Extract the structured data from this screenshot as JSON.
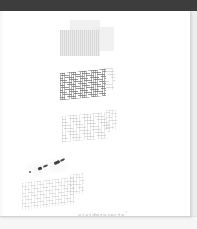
{
  "app": {
    "toolbar": {
      "name": "document-viewer-toolbar",
      "color": "#3d3d3d",
      "label": ""
    },
    "background_color": "#ededed"
  },
  "document": {
    "page_background": "#ffffff",
    "page_number_visible": false,
    "wordmark": {
      "text": "vividprojects",
      "trademark_symbol": "™",
      "color": "#9a9a9a"
    },
    "blocks": [
      {
        "id": "panel-group-top",
        "name": "faded-panel-group",
        "kind": "overlapping-grey-panels",
        "panels": [
          {
            "id": "panel-back",
            "color": "#efefef"
          },
          {
            "id": "panel-front",
            "color": "#e9e9e9"
          },
          {
            "id": "panel-right",
            "color": "#efefef"
          }
        ]
      },
      {
        "id": "grid-1",
        "name": "faded-table-grid-dense",
        "kind": "sheared-table-grid",
        "density": "dense",
        "skew_degrees": -5.5
      },
      {
        "id": "grid-2",
        "name": "faded-table-grid-faint",
        "kind": "sheared-table-grid",
        "density": "faint",
        "skew_degrees": -4.5
      },
      {
        "id": "grid-3",
        "name": "faded-table-grid-ghost",
        "kind": "sheared-table-grid",
        "density": "ghost",
        "skew_degrees": -6.5
      }
    ],
    "ink_marks": {
      "name": "handwritten-ink-marks",
      "color": "#4a4a4a",
      "count": 5
    }
  }
}
